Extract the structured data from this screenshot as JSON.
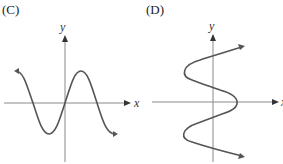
{
  "panels": [
    {
      "label": "(C)",
      "x_axis_label": "x",
      "y_axis_label": "y",
      "description": "Sine-like curve y = sin(x) crossing origin, one full period with arrows at both ends"
    },
    {
      "label": "(D)",
      "x_axis_label": "x",
      "y_axis_label": "y",
      "description": "Sine-like curve oriented vertically, x as a function of y, with arrows at both ends"
    }
  ],
  "colors": {
    "axis": "#8a8a8a",
    "curve": "#555555",
    "text": "#222222"
  }
}
